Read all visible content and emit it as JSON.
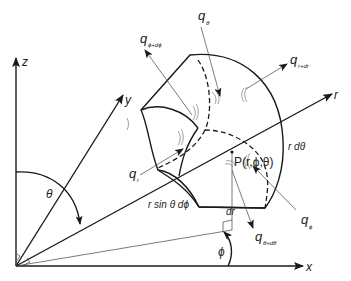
{
  "diagram": {
    "axes": {
      "z": "z",
      "y": "y",
      "x": "x",
      "r": "r"
    },
    "angles": {
      "theta": "θ",
      "phi": "ϕ"
    },
    "point_label": "P(r,ϕ,θ)",
    "dimensions": {
      "r_dtheta": "r dθ",
      "r_sin_theta_dphi": "r sin θ dϕ",
      "dr": "dr"
    },
    "fluxes": {
      "q_r": {
        "base": "q",
        "sub": "r"
      },
      "q_r_dr": {
        "base": "q",
        "sub": "r+dr"
      },
      "q_theta": {
        "base": "q",
        "sub": "θ"
      },
      "q_theta_dtheta": {
        "base": "q",
        "sub": "θ+dθ"
      },
      "q_phi": {
        "base": "q",
        "sub": "ϕ"
      },
      "q_phi_dphi": {
        "base": "q",
        "sub": "ϕ+dϕ"
      }
    },
    "colors": {
      "line": "#1a1a1a",
      "thin_line": "#444444",
      "background": "#ffffff"
    }
  }
}
